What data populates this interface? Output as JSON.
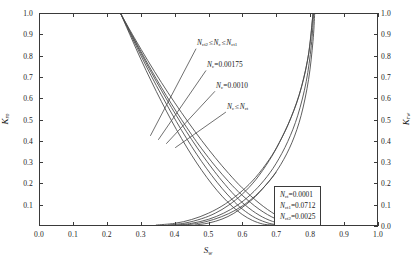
{
  "chart_data": {
    "type": "line",
    "title": "",
    "xlabel": "Sw",
    "ylabel": "Kro",
    "ylabel_right": "Krw",
    "xlim": [
      0.0,
      1.0
    ],
    "ylim": [
      0.0,
      1.0
    ],
    "grid": false,
    "legend_position": "inside-bottom-right",
    "x_ticks": [
      "0.0",
      "0.1",
      "0.2",
      "0.3",
      "0.4",
      "0.5",
      "0.6",
      "0.7",
      "0.8",
      "0.9",
      "1.0"
    ],
    "x_tick_values": [
      0.0,
      0.1,
      0.2,
      0.3,
      0.4,
      0.5,
      0.6,
      0.7,
      0.8,
      0.9,
      1.0
    ],
    "y_ticks_left": [
      "0.1",
      "0.2",
      "0.3",
      "0.4",
      "0.5",
      "0.6",
      "0.7",
      "0.8",
      "0.9",
      "1.0"
    ],
    "y_tick_values_left": [
      0.1,
      0.2,
      0.3,
      0.4,
      0.5,
      0.6,
      0.7,
      0.8,
      0.9,
      1.0
    ],
    "y_ticks_right": [
      "0.0",
      "0.1",
      "0.2",
      "0.3",
      "0.4",
      "0.5",
      "0.6",
      "0.7",
      "0.8",
      "0.9",
      "1.0"
    ],
    "y_tick_values_right": [
      0.0,
      0.1,
      0.2,
      0.3,
      0.4,
      0.5,
      0.6,
      0.7,
      0.8,
      0.9,
      1.0
    ],
    "line_color": "#4a4a4a",
    "frame_color": "#3a3a3a",
    "series": [
      {
        "name": "Kro (Nc <= Nct)",
        "branch": "oil",
        "swc": 0.24,
        "sor_end": 0.7,
        "exponent": 2.1,
        "x": [
          0.24,
          0.27,
          0.3,
          0.33,
          0.36,
          0.39,
          0.42,
          0.45,
          0.48,
          0.51,
          0.54,
          0.57,
          0.6,
          0.63,
          0.66,
          0.68,
          0.7
        ],
        "y": [
          1.0,
          0.89,
          0.783,
          0.682,
          0.586,
          0.495,
          0.41,
          0.331,
          0.259,
          0.194,
          0.137,
          0.089,
          0.05,
          0.022,
          0.005,
          0.001,
          0.0
        ]
      },
      {
        "name": "Kro (Nc = 0.0010)",
        "branch": "oil",
        "swc": 0.24,
        "sor_end": 0.735,
        "exponent": 2.1,
        "x": [
          0.24,
          0.27,
          0.3,
          0.33,
          0.36,
          0.39,
          0.42,
          0.45,
          0.48,
          0.51,
          0.54,
          0.57,
          0.6,
          0.64,
          0.68,
          0.71,
          0.735
        ],
        "y": [
          1.0,
          0.899,
          0.801,
          0.707,
          0.617,
          0.531,
          0.449,
          0.372,
          0.3,
          0.234,
          0.174,
          0.121,
          0.076,
          0.033,
          0.008,
          0.001,
          0.0
        ]
      },
      {
        "name": "Kro (Nc = 0.00175)",
        "branch": "oil",
        "swc": 0.24,
        "sor_end": 0.765,
        "exponent": 2.1,
        "x": [
          0.24,
          0.27,
          0.3,
          0.33,
          0.36,
          0.39,
          0.42,
          0.45,
          0.48,
          0.51,
          0.54,
          0.58,
          0.62,
          0.66,
          0.7,
          0.74,
          0.765
        ],
        "y": [
          1.0,
          0.905,
          0.813,
          0.724,
          0.639,
          0.557,
          0.479,
          0.405,
          0.335,
          0.27,
          0.209,
          0.137,
          0.08,
          0.038,
          0.012,
          0.001,
          0.0
        ]
      },
      {
        "name": "Kro (Nct2 <= Nc <= Nct1)",
        "branch": "oil",
        "swc": 0.24,
        "sor_end": 0.79,
        "exponent": 2.1,
        "x": [
          0.24,
          0.27,
          0.3,
          0.33,
          0.36,
          0.39,
          0.42,
          0.45,
          0.48,
          0.52,
          0.56,
          0.6,
          0.65,
          0.7,
          0.75,
          0.78,
          0.79
        ],
        "y": [
          1.0,
          0.909,
          0.821,
          0.735,
          0.653,
          0.574,
          0.499,
          0.428,
          0.361,
          0.279,
          0.205,
          0.141,
          0.075,
          0.029,
          0.004,
          0.0,
          0.0
        ]
      },
      {
        "name": "Kro (upper bound)",
        "branch": "oil",
        "swc": 0.24,
        "sor_end": 0.805,
        "exponent": 2.1,
        "x": [
          0.24,
          0.28,
          0.32,
          0.36,
          0.4,
          0.44,
          0.48,
          0.52,
          0.56,
          0.6,
          0.65,
          0.7,
          0.75,
          0.79,
          0.805
        ],
        "y": [
          1.0,
          0.887,
          0.779,
          0.676,
          0.579,
          0.487,
          0.4,
          0.319,
          0.244,
          0.176,
          0.104,
          0.048,
          0.012,
          0.0,
          0.0
        ]
      },
      {
        "name": "Krw (Nc <= Nct)",
        "branch": "water",
        "sw_start": 0.345,
        "sw_end": 0.81,
        "exponent": 2.4,
        "x": [
          0.345,
          0.4,
          0.45,
          0.5,
          0.55,
          0.6,
          0.64,
          0.68,
          0.71,
          0.74,
          0.77,
          0.795,
          0.81
        ],
        "y": [
          0.0,
          0.008,
          0.026,
          0.056,
          0.1,
          0.162,
          0.226,
          0.31,
          0.39,
          0.49,
          0.62,
          0.79,
          1.0
        ]
      },
      {
        "name": "Krw (Nc = 0.0010)",
        "branch": "water",
        "sw_start": 0.38,
        "sw_end": 0.81,
        "exponent": 2.4,
        "x": [
          0.38,
          0.43,
          0.48,
          0.52,
          0.56,
          0.6,
          0.64,
          0.68,
          0.71,
          0.745,
          0.775,
          0.798,
          0.81
        ],
        "y": [
          0.0,
          0.009,
          0.03,
          0.056,
          0.094,
          0.146,
          0.214,
          0.305,
          0.39,
          0.51,
          0.65,
          0.82,
          1.0
        ]
      },
      {
        "name": "Krw (Nc = 0.00175)",
        "branch": "water",
        "sw_start": 0.405,
        "sw_end": 0.812,
        "exponent": 2.4,
        "x": [
          0.405,
          0.45,
          0.5,
          0.545,
          0.585,
          0.625,
          0.665,
          0.7,
          0.735,
          0.765,
          0.79,
          0.805,
          0.812
        ],
        "y": [
          0.0,
          0.008,
          0.027,
          0.056,
          0.093,
          0.144,
          0.212,
          0.29,
          0.395,
          0.52,
          0.68,
          0.85,
          1.0
        ]
      },
      {
        "name": "Krw (Nct2 <= Nc <= Nct1)",
        "branch": "water",
        "sw_start": 0.425,
        "sw_end": 0.815,
        "exponent": 2.4,
        "x": [
          0.425,
          0.47,
          0.515,
          0.56,
          0.6,
          0.64,
          0.68,
          0.715,
          0.748,
          0.775,
          0.797,
          0.81,
          0.815
        ],
        "y": [
          0.0,
          0.008,
          0.026,
          0.054,
          0.09,
          0.14,
          0.208,
          0.288,
          0.392,
          0.52,
          0.69,
          0.87,
          1.0
        ]
      },
      {
        "name": "Krw (short segment)",
        "branch": "water-short",
        "sw_start": 0.46,
        "sw_end": 0.7,
        "exponent": 2.4,
        "x": [
          0.46,
          0.5,
          0.54,
          0.575,
          0.61,
          0.64,
          0.665,
          0.685,
          0.7
        ],
        "y": [
          0.0,
          0.009,
          0.028,
          0.055,
          0.095,
          0.136,
          0.18,
          0.217,
          0.248
        ]
      }
    ],
    "annotations": [
      {
        "id": "annot-nct-range",
        "text": "Nct2 ≤ Nc ≤ Nct1",
        "symbol": "N",
        "sub1": "ct2",
        "relation": "≤",
        "sub2": "c",
        "sub3": "ct1",
        "label_x": 197,
        "label_y": 38,
        "leader_from": [
          196,
          48
        ],
        "leader_to": [
          150,
          136
        ]
      },
      {
        "id": "annot-nc-00175",
        "text": "Nc=0.00175",
        "symbol": "N",
        "sub1": "c",
        "value": "0.00175",
        "label_x": 207,
        "label_y": 60,
        "leader_from": [
          206,
          70
        ],
        "leader_to": [
          158,
          140
        ]
      },
      {
        "id": "annot-nc-0010",
        "text": "Nc=0.0010",
        "symbol": "N",
        "sub1": "c",
        "value": "0.0010",
        "label_x": 216,
        "label_y": 81,
        "leader_from": [
          215,
          91
        ],
        "leader_to": [
          166,
          144
        ]
      },
      {
        "id": "annot-nc-le-nct",
        "text": "Nc ≤ Nct",
        "symbol": "N",
        "sub1": "c",
        "relation": "≤",
        "sub2": "ct",
        "label_x": 227,
        "label_y": 102,
        "leader_from": [
          226,
          112
        ],
        "leader_to": [
          175,
          148
        ]
      }
    ]
  },
  "axes": {
    "x_title_symbol": "S",
    "x_title_sub": "w",
    "y_title_left_symbol": "K",
    "y_title_left_sub": "ro",
    "y_title_right_symbol": "K",
    "y_title_right_sub": "rw"
  },
  "legend": {
    "rows": [
      {
        "symbol": "N",
        "sub": "ct",
        "eq": "=",
        "value": "0.0001"
      },
      {
        "symbol": "N",
        "sub": "ct1",
        "eq": "=",
        "value": "0.0712"
      },
      {
        "symbol": "N",
        "sub": "ct2",
        "eq": "=",
        "value": "0.0025"
      }
    ]
  }
}
